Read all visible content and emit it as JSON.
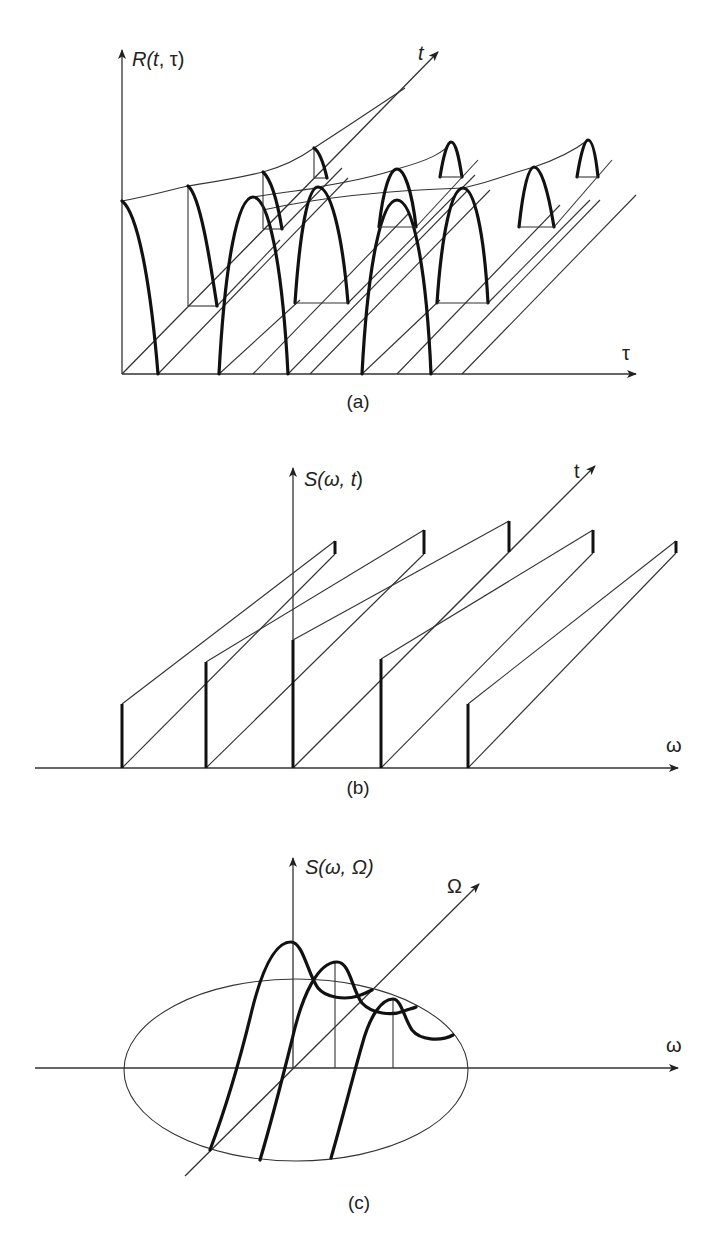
{
  "figure": {
    "panels": [
      {
        "id": "a",
        "caption": "(a)",
        "vertical_axis_label": "R(t, τ)",
        "horizontal_axis_label": "τ",
        "depth_axis_label": "t",
        "description": "Time-varying autocorrelation: periodic lobes in τ repeated along t, with envelope curves"
      },
      {
        "id": "b",
        "caption": "(b)",
        "vertical_axis_label": "S(ω, t)",
        "horizontal_axis_label": "ω",
        "depth_axis_label": "t",
        "description": "Time-varying spectrum: discrete spectral lines at five frequencies, heights varying along t"
      },
      {
        "id": "c",
        "caption": "(c)",
        "vertical_axis_label": "S(ω, Ω)",
        "horizontal_axis_label": "ω",
        "depth_axis_label": "Ω",
        "description": "Cyclic spectrum: three damped peaks along the Ω direction inside an elliptical support region"
      }
    ]
  },
  "labels": {
    "a": {
      "y": "R(",
      "y_t": "t",
      "y_rest": ", τ)",
      "x": "τ",
      "depth": "t",
      "caption": "(a)"
    },
    "b": {
      "y": "S(ω, ",
      "y_t": "t",
      "y_rest": ")",
      "x": "ω",
      "depth": "t",
      "caption": "(b)"
    },
    "c": {
      "y": "S(ω, Ω)",
      "x": "ω",
      "depth": "Ω",
      "caption": "(c)"
    }
  },
  "colors": {
    "ink": "#111111",
    "line": "#333333",
    "background": "#ffffff"
  }
}
